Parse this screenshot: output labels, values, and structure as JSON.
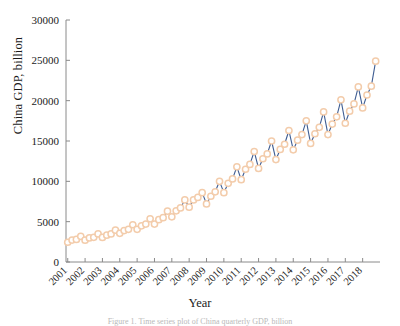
{
  "figure": {
    "ylabel": "China GDP, billion",
    "xlabel": "Year",
    "caption": "Figure 1. Time series plot of China quarterly GDP, billion"
  },
  "style": {
    "line_color": "#3f5d92",
    "marker_edge_color": "#f3ccab",
    "marker_face_color": "#ffffff",
    "axis_color": "#8a8a8a",
    "background": "#ffffff"
  },
  "chart_data": {
    "type": "line",
    "title": "",
    "xlabel": "Year",
    "ylabel": "China GDP, billion",
    "xlim": [
      2000.9,
      2019.0
    ],
    "ylim": [
      0,
      30000
    ],
    "ytick_values": [
      0,
      5000,
      10000,
      15000,
      20000,
      25000,
      30000
    ],
    "ytick_labels": [
      "0",
      "5000",
      "10000",
      "15000",
      "20000",
      "25000",
      "30000"
    ],
    "xtick_values": [
      2001,
      2002,
      2003,
      2004,
      2005,
      2006,
      2007,
      2008,
      2009,
      2010,
      2011,
      2012,
      2013,
      2014,
      2015,
      2016,
      2017,
      2018
    ],
    "xtick_labels": [
      "2001",
      "2002",
      "2003",
      "2004",
      "2005",
      "2006",
      "2007",
      "2008",
      "2009",
      "2010",
      "2011",
      "2012",
      "2013",
      "2014",
      "2015",
      "2016",
      "2017",
      "2018"
    ],
    "xtick_rotation": 45,
    "grid": false,
    "legend": null,
    "marker": "circle",
    "series": [
      {
        "name": "China GDP",
        "frequency": "quarterly",
        "x": [
          2001.0,
          2001.25,
          2001.5,
          2001.75,
          2002.0,
          2002.25,
          2002.5,
          2002.75,
          2003.0,
          2003.25,
          2003.5,
          2003.75,
          2004.0,
          2004.25,
          2004.5,
          2004.75,
          2005.0,
          2005.25,
          2005.5,
          2005.75,
          2006.0,
          2006.25,
          2006.5,
          2006.75,
          2007.0,
          2007.25,
          2007.5,
          2007.75,
          2008.0,
          2008.25,
          2008.5,
          2008.75,
          2009.0,
          2009.25,
          2009.5,
          2009.75,
          2010.0,
          2010.25,
          2010.5,
          2010.75,
          2011.0,
          2011.25,
          2011.5,
          2011.75,
          2012.0,
          2012.25,
          2012.5,
          2012.75,
          2013.0,
          2013.25,
          2013.5,
          2013.75,
          2014.0,
          2014.25,
          2014.5,
          2014.75,
          2015.0,
          2015.25,
          2015.5,
          2015.75,
          2016.0,
          2016.25,
          2016.5,
          2016.75,
          2017.0,
          2017.25,
          2017.5,
          2017.75,
          2018.0,
          2018.25,
          2018.5,
          2018.75
        ],
        "values": [
          2450,
          2720,
          2800,
          3180,
          2700,
          2980,
          3060,
          3480,
          3050,
          3320,
          3480,
          3950,
          3550,
          3900,
          4050,
          4620,
          4050,
          4480,
          4700,
          5350,
          4700,
          5250,
          5500,
          6300,
          5600,
          6350,
          6700,
          7700,
          6800,
          7700,
          8000,
          8600,
          7200,
          8150,
          8700,
          10000,
          8600,
          9750,
          10300,
          11800,
          10200,
          11500,
          12100,
          13700,
          11600,
          12800,
          13400,
          15000,
          12700,
          13950,
          14600,
          16300,
          13900,
          15100,
          15800,
          17500,
          14700,
          15900,
          16700,
          18600,
          15800,
          17100,
          18000,
          20100,
          17200,
          18700,
          19600,
          21700,
          19100,
          20700,
          21800,
          24900
        ]
      }
    ]
  }
}
